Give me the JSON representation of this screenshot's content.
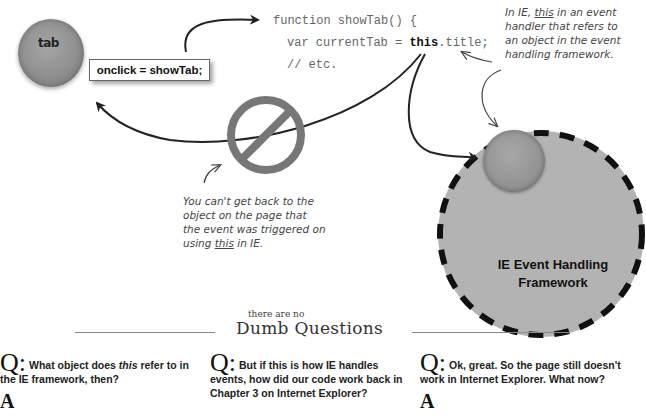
{
  "diagram": {
    "tab_object": {
      "label": "tab",
      "handler_box": "onclick = showTab;"
    },
    "code": {
      "line1": "function showTab() {",
      "line2_prefix": "var currentTab = ",
      "line2_keyword": "this",
      "line2_suffix": ".title;",
      "line3": "// etc."
    },
    "annotation_top": {
      "line1_pre": "In IE, ",
      "line1_keyword": "this",
      "line1_post": " in an event",
      "line2": "handler that refers to",
      "line3": "an object in the event",
      "line4": "handling framework."
    },
    "annotation_bottom": {
      "line1": "You can't get back to the",
      "line2": "object on the page that",
      "line3": "the event was triggered on",
      "line4_pre": "using ",
      "line4_keyword": "this",
      "line4_post": " in IE."
    },
    "framework": {
      "label_line1": "IE Event Handling",
      "label_line2": "Framework"
    },
    "icons": {
      "prohibited": "prohibited-icon",
      "tab_object": "sphere-icon",
      "framework_object": "sphere-icon"
    },
    "colors": {
      "sphere": "#8f8f8f",
      "framework_fill": "#b3b3b3",
      "dash": "#111111",
      "prohibited": "#777777"
    }
  },
  "section_header": {
    "small": "there are no",
    "big": "Dumb Questions"
  },
  "questions": [
    {
      "q_mark": "Q:",
      "text_pre": "What object does ",
      "text_em": "this",
      "text_post": " refer to in the IE framework, then?",
      "a_mark": "A"
    },
    {
      "q_mark": "Q:",
      "text": "But if this is how IE handles events, how did our code work back in Chapter 3 on Internet Explorer?"
    },
    {
      "q_mark": "Q:",
      "text": "Ok, great. So the page still doesn't work in Internet Explorer. What now?",
      "a_mark": "A"
    }
  ]
}
